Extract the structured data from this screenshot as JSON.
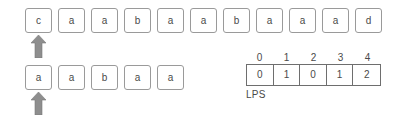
{
  "diagram": {
    "text_row": {
      "name": "text",
      "cells": [
        {
          "char": "c"
        },
        {
          "char": "a"
        },
        {
          "char": "a"
        },
        {
          "char": "b"
        },
        {
          "char": "a"
        },
        {
          "char": "a"
        },
        {
          "char": "b"
        },
        {
          "char": "a"
        },
        {
          "char": "a"
        },
        {
          "char": "a"
        },
        {
          "char": "d"
        }
      ]
    },
    "pattern_row": {
      "name": "pattern",
      "cells": [
        {
          "char": "a"
        },
        {
          "char": "a"
        },
        {
          "char": "b"
        },
        {
          "char": "a"
        },
        {
          "char": "a"
        }
      ]
    },
    "pointers": {
      "text_pointer": {
        "icon": "up-arrow-icon",
        "index": 0,
        "color": "#8e8e8e"
      },
      "pattern_pointer": {
        "icon": "up-arrow-icon",
        "index": 0,
        "color": "#8e8e8e"
      }
    },
    "lps_table": {
      "label": "LPS",
      "indices": [
        "0",
        "1",
        "2",
        "3",
        "4"
      ],
      "values": [
        "0",
        "1",
        "0",
        "1",
        "2"
      ]
    }
  },
  "colors": {
    "cell_border": "#9a9a9a",
    "table_border": "#6e6e6e",
    "text": "#4a4a4a",
    "arrow": "#8e8e8e",
    "background": "#ffffff"
  }
}
